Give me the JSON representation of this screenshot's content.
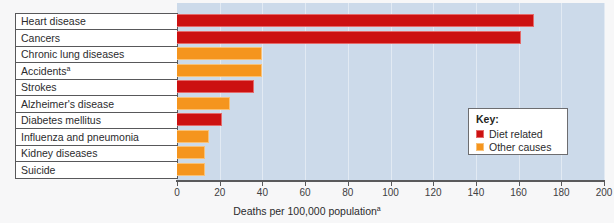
{
  "chart_data": {
    "type": "bar",
    "orientation": "horizontal",
    "title": "",
    "xlabel": "Deaths per 100,000 population",
    "xlabel_superscript": "a",
    "ylabel": "",
    "xlim": [
      0,
      200
    ],
    "xticks": [
      0,
      20,
      40,
      60,
      80,
      100,
      120,
      140,
      160,
      180,
      200
    ],
    "xtick_labels": [
      "0",
      "20",
      "40",
      "60",
      "80",
      "100",
      "120",
      "140",
      "160",
      "180",
      "200"
    ],
    "grid": true,
    "legend_position": "inside-right",
    "categories": [
      "Heart disease",
      "Cancers",
      "Chronic lung diseases",
      "Accidents",
      "Strokes",
      "Alzheimer's disease",
      "Diabetes mellitus",
      "Influenza and pneumonia",
      "Kidney diseases",
      "Suicide"
    ],
    "category_superscripts": [
      "",
      "",
      "",
      "a",
      "",
      "",
      "",
      "",
      "",
      ""
    ],
    "values": [
      167,
      161,
      40,
      40,
      36,
      25,
      21,
      15,
      13,
      13
    ],
    "series": [
      {
        "name": "Diet related",
        "color": "#cc1111",
        "members": [
          "Heart disease",
          "Cancers",
          "Strokes",
          "Diabetes mellitus"
        ]
      },
      {
        "name": "Other causes",
        "color": "#f5951e",
        "members": [
          "Chronic lung diseases",
          "Accidents",
          "Alzheimer's disease",
          "Influenza and pneumonia",
          "Kidney diseases",
          "Suicide"
        ]
      }
    ],
    "bar_categories": [
      {
        "label": "Heart disease",
        "superscript": "",
        "value": 167,
        "group": "diet"
      },
      {
        "label": "Cancers",
        "superscript": "",
        "value": 161,
        "group": "diet"
      },
      {
        "label": "Chronic lung diseases",
        "superscript": "",
        "value": 40,
        "group": "other"
      },
      {
        "label": "Accidents",
        "superscript": "a",
        "value": 40,
        "group": "other"
      },
      {
        "label": "Strokes",
        "superscript": "",
        "value": 36,
        "group": "diet"
      },
      {
        "label": "Alzheimer's disease",
        "superscript": "",
        "value": 25,
        "group": "other"
      },
      {
        "label": "Diabetes mellitus",
        "superscript": "",
        "value": 21,
        "group": "diet"
      },
      {
        "label": "Influenza and pneumonia",
        "superscript": "",
        "value": 15,
        "group": "other"
      },
      {
        "label": "Kidney diseases",
        "superscript": "",
        "value": 13,
        "group": "other"
      },
      {
        "label": "Suicide",
        "superscript": "",
        "value": 13,
        "group": "other"
      }
    ]
  },
  "key": {
    "title": "Key:",
    "items": [
      {
        "label": "Diet related",
        "color": "#cc1111",
        "group": "diet"
      },
      {
        "label": "Other causes",
        "color": "#f5951e",
        "group": "other"
      }
    ]
  },
  "colors": {
    "plot_background": "#ccdaea",
    "page_background": "#f7f7f8",
    "diet_related": "#cc1111",
    "other_causes": "#f5951e",
    "axis": "#5a5a5c",
    "gridline": "#e2eaf3",
    "table_border": "#58585a"
  }
}
